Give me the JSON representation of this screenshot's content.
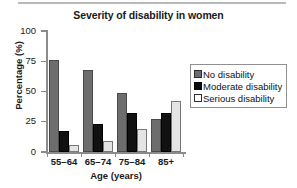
{
  "chart_data": {
    "type": "bar",
    "title": "Severity of disability in women",
    "xlabel": "Age (years)",
    "ylabel": "Percentage (%)",
    "categories": [
      "55–64",
      "65–74",
      "75–84",
      "85+"
    ],
    "series": [
      {
        "name": "No disability",
        "color": "#6d6d6d",
        "values": [
          76,
          68,
          49,
          27
        ]
      },
      {
        "name": "Moderate disability",
        "color": "#111111",
        "values": [
          17,
          23,
          32,
          32
        ]
      },
      {
        "name": "Serious disability",
        "color": "#e4e4e4",
        "values": [
          6,
          9,
          19,
          42
        ]
      }
    ],
    "ylim": [
      0,
      100
    ],
    "yticks": [
      0,
      25,
      50,
      75,
      100
    ],
    "ytick_labels": [
      "0",
      "25",
      "50",
      "75",
      "100"
    ],
    "grid": false,
    "legend_position": "right"
  },
  "legend": {
    "entries": [
      {
        "label": "No disability"
      },
      {
        "label": "Moderate disability"
      },
      {
        "label": "Serious disability"
      }
    ]
  }
}
